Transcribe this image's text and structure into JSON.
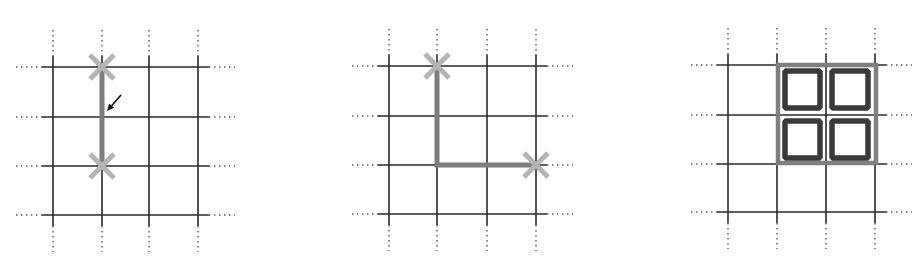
{
  "colors": {
    "background": "#ffffff",
    "grid_line": "#2a2a2a",
    "grid_dots": "#555555",
    "path": "#7d7d7d",
    "x_marker": "#b4b4b4",
    "arrow": "#111111",
    "block_outer": "#7f7f7f",
    "block_inner": "#3a3a3a"
  },
  "panels": [
    {
      "id": "panel-1",
      "description": "Vertical edge segment between two crossing markers with pointer arrow",
      "grid": {
        "xs": [
          53,
          102,
          149,
          198
        ],
        "ys": [
          67,
          117,
          166,
          215
        ]
      },
      "path": [
        [
          102,
          67
        ],
        [
          102,
          166
        ]
      ],
      "markers": [
        [
          102,
          67
        ],
        [
          102,
          166
        ]
      ],
      "arrow": {
        "from": [
          121,
          95
        ],
        "to": [
          107,
          111
        ]
      },
      "blocks": []
    },
    {
      "id": "panel-2",
      "description": "L-shaped edge path between two crossing markers",
      "grid": {
        "xs": [
          389,
          437,
          487,
          536
        ],
        "ys": [
          66,
          116,
          165,
          214
        ]
      },
      "path": [
        [
          437,
          66
        ],
        [
          437,
          165
        ],
        [
          536,
          165
        ]
      ],
      "markers": [
        [
          437,
          66
        ],
        [
          536,
          165
        ]
      ],
      "arrow": null,
      "blocks": []
    },
    {
      "id": "panel-3",
      "description": "2x2 block of selected cells with thick outlined squares",
      "grid": {
        "xs": [
          728,
          777,
          826,
          875
        ],
        "ys": [
          65,
          115,
          164,
          212
        ]
      },
      "path": [],
      "markers": [],
      "arrow": null,
      "outer_block": {
        "x": 778,
        "y": 65,
        "w": 98,
        "h": 98
      },
      "blocks": [
        {
          "x": 785,
          "y": 71,
          "w": 35,
          "h": 37
        },
        {
          "x": 832,
          "y": 71,
          "w": 36,
          "h": 37
        },
        {
          "x": 785,
          "y": 121,
          "w": 35,
          "h": 37
        },
        {
          "x": 832,
          "y": 121,
          "w": 36,
          "h": 37
        }
      ]
    }
  ],
  "grid_style": {
    "line_overhang": 11,
    "dot_extension": 26
  },
  "marker_style": {
    "half_size": 12
  }
}
